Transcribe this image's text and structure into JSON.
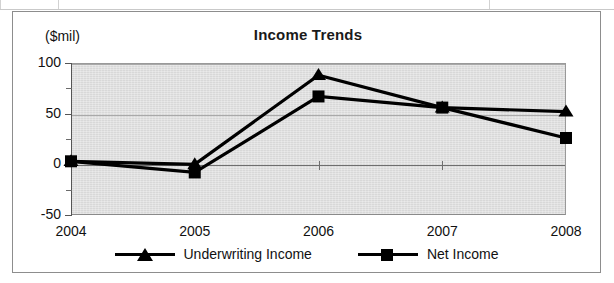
{
  "frame": {
    "has_outer_border": true
  },
  "chart_data": {
    "type": "line",
    "title": "Income Trends",
    "xlabel": "",
    "ylabel": "($mil)",
    "categories": [
      "2004",
      "2005",
      "2006",
      "2007",
      "2008"
    ],
    "series": [
      {
        "name": "Underwriting Income",
        "marker": "triangle",
        "color": "#000000",
        "values": [
          3,
          0,
          88,
          56,
          52
        ]
      },
      {
        "name": "Net Income",
        "marker": "square",
        "color": "#000000",
        "values": [
          3,
          -8,
          67,
          56,
          26
        ]
      }
    ],
    "ylim": [
      -50,
      100
    ],
    "y_major_ticks": [
      100,
      50,
      0,
      -50
    ],
    "y_major_tick_labels": [
      "100",
      "50",
      "0",
      "-50"
    ],
    "y_minor_ticks": [
      75,
      25,
      -25
    ],
    "grid": true,
    "gridlines_at": [
      100,
      50,
      0
    ],
    "legend_position": "bottom",
    "plot_background": "#d8d8d8",
    "line_color": "#000000"
  }
}
